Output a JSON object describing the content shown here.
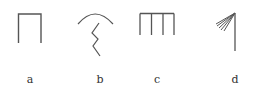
{
  "figure": {
    "stroke_color": "#555555",
    "panels": [
      {
        "id": "a",
        "label": "a",
        "shape": "inverted-u-bracket",
        "label_x": 30,
        "label_y": 75
      },
      {
        "id": "b",
        "label": "b",
        "shape": "arc-with-zigzag",
        "label_x": 100,
        "label_y": 75
      },
      {
        "id": "c",
        "label": "c",
        "shape": "comb-four-prongs",
        "label_x": 157,
        "label_y": 75
      },
      {
        "id": "d",
        "label": "d",
        "shape": "vertical-line-with-fan",
        "label_x": 235,
        "label_y": 75
      }
    ]
  }
}
